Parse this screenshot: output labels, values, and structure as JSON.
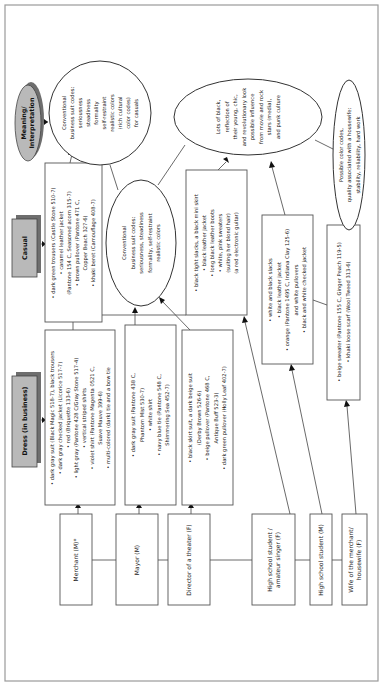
{
  "headers": {
    "dress": "Dress (in business)",
    "casual": "Casual",
    "meaning": [
      "Meaning/",
      "Interpretation"
    ]
  },
  "roles": [
    {
      "lines": [
        "Merchant (M)*"
      ]
    },
    {
      "lines": [
        "Mayor (M)"
      ]
    },
    {
      "lines": [
        "Director of a theater (F)"
      ]
    },
    {
      "lines": [
        "High school student /",
        "amateur singer (F)"
      ]
    },
    {
      "lines": [
        "High school student (M)"
      ]
    },
    {
      "lines": [
        "Wife of the merchant/",
        "housewife (F)"
      ]
    }
  ],
  "dress_boxes": {
    "merchant": [
      "• dark gray suit (Black Magic 518-7), black trousers",
      "• dark gray checked jacket (Licorice 517-7)",
      "• red (Briquette 133-6)",
      "• light gray (Pantone 428 C/Gray Stone 517-4)",
      "• vertical striped shirts",
      "• violet shirt (Pantone Magenta 0521 C,",
      "Suave Mauve 399-6)",
      "• multi-colored (dark) tie and a bow tie"
    ],
    "mayor": [
      "• dark gray suit (Pantone 438 C,",
      "Phantom Mist 530-7)",
      "• white shirt",
      "• navy blue tie (Pantone 548 C,",
      "Shimmering Sea 452-7)"
    ],
    "director": [
      "• black skirt suit, a dark beige suit",
      "(Derby Brown 526-6)",
      "• beige pullover (Pantone 468 C,",
      "Antique Buff 523-3)",
      "• dark green pullover (Holly Leaf 402-7)"
    ]
  },
  "casual_boxes": {
    "merchant": [
      "• dark green trousers (Castle Stone 510-7)",
      "• caramel leather jacket",
      "(Pantone 154 C, Seasoned acorn 315-7)",
      "• brown pullover (Pantone 471 C,",
      "Copper Beach 327-6)",
      "• khaki beret (Camouflage 408-7)"
    ],
    "singer": [
      "• black tight slacks, a black mini skirt",
      "• black leather jacket",
      "• long black leather boots",
      "• white, pink sweaters",
      "(suiting her blond hair)",
      "(a red electronic guitar)"
    ],
    "student": [
      "• white and black slacks",
      "• black leather jacket",
      "• orange (Pantone 1495 C, Indiana Clay 125-6)",
      "and white pullovers",
      "• black and white checked jacket"
    ],
    "wife": [
      "• beige sweater (Pantone 155 C, Ginger Peach 119-5)",
      "• khaki loose scarf (Wool Tweed 313-6)"
    ]
  },
  "interpretations": {
    "casual_business": [
      "Conventional",
      "business suit codes:",
      "seriousness",
      "steadiness",
      "formality",
      "self-restraint",
      "realistic colors",
      "(rich cultural",
      "color codes)",
      "for casuals"
    ],
    "dress_business": [
      "Conventional",
      "business suit codes:",
      "seriousness, steadiness",
      "formality, self-restraint",
      "realistic colors"
    ],
    "youth": [
      "Lots of black,",
      "reflection of",
      "their young, chic,",
      "and revolutionary look",
      "possible influence",
      "from movie and rock",
      "stars (media),",
      "and punk culture"
    ],
    "housewife": [
      "Possible color codes,",
      "quality associated with a housewife:",
      "stability, reliability, hard work"
    ]
  }
}
